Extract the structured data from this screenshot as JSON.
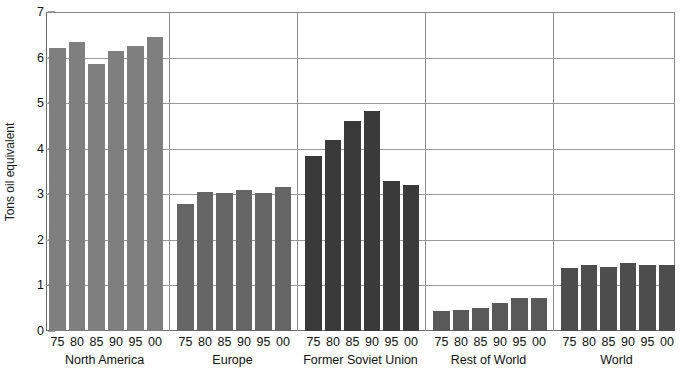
{
  "chart_data": {
    "type": "bar",
    "title": "",
    "xlabel": "",
    "ylabel": "Tons oil equivalent",
    "ylim": [
      0,
      7
    ],
    "ytick_labels": [
      "0",
      "1",
      "2",
      "3",
      "4",
      "5",
      "6",
      "7"
    ],
    "ytick_values": [
      0,
      1,
      2,
      3,
      4,
      5,
      6,
      7
    ],
    "grid": true,
    "legend": "none",
    "categories": [
      "75",
      "80",
      "85",
      "90",
      "95",
      "00"
    ],
    "groups": [
      {
        "name": "North America",
        "color": "#7f7f7f",
        "categories": [
          "75",
          "80",
          "85",
          "90",
          "95",
          "00"
        ],
        "values": [
          6.2,
          6.35,
          5.85,
          6.15,
          6.25,
          6.45
        ]
      },
      {
        "name": "Europe",
        "color": "#666666",
        "categories": [
          "75",
          "80",
          "85",
          "90",
          "95",
          "00"
        ],
        "values": [
          2.78,
          3.06,
          3.02,
          3.1,
          3.02,
          3.17
        ]
      },
      {
        "name": "Former Soviet Union",
        "color": "#3a3a3a",
        "categories": [
          "75",
          "80",
          "85",
          "90",
          "95",
          "00"
        ],
        "values": [
          3.85,
          4.2,
          4.6,
          4.82,
          3.3,
          3.2
        ]
      },
      {
        "name": "Rest of World",
        "color": "#595959",
        "categories": [
          "75",
          "80",
          "85",
          "90",
          "95",
          "00"
        ],
        "values": [
          0.44,
          0.47,
          0.51,
          0.62,
          0.72,
          0.72
        ]
      },
      {
        "name": "World",
        "color": "#4d4d4d",
        "categories": [
          "75",
          "80",
          "85",
          "90",
          "95",
          "00"
        ],
        "values": [
          1.39,
          1.45,
          1.41,
          1.5,
          1.45,
          1.45
        ]
      }
    ]
  },
  "colors": {
    "background": "#ffffff",
    "axis": "#6b6b6b",
    "grid": "#9a9a9a",
    "text": "#111111"
  }
}
